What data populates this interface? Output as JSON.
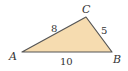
{
  "diagram": {
    "type": "triangle",
    "fill_color": "#f6dcb0",
    "stroke_color": "#555555",
    "vertices": [
      {
        "label": "A",
        "x": 22,
        "y": 52
      },
      {
        "label": "B",
        "x": 112,
        "y": 52
      },
      {
        "label": "C",
        "x": 86,
        "y": 17
      }
    ],
    "sides": [
      {
        "between": "AC",
        "length": "8"
      },
      {
        "between": "CB",
        "length": "5"
      },
      {
        "between": "AB",
        "length": "10"
      }
    ]
  }
}
